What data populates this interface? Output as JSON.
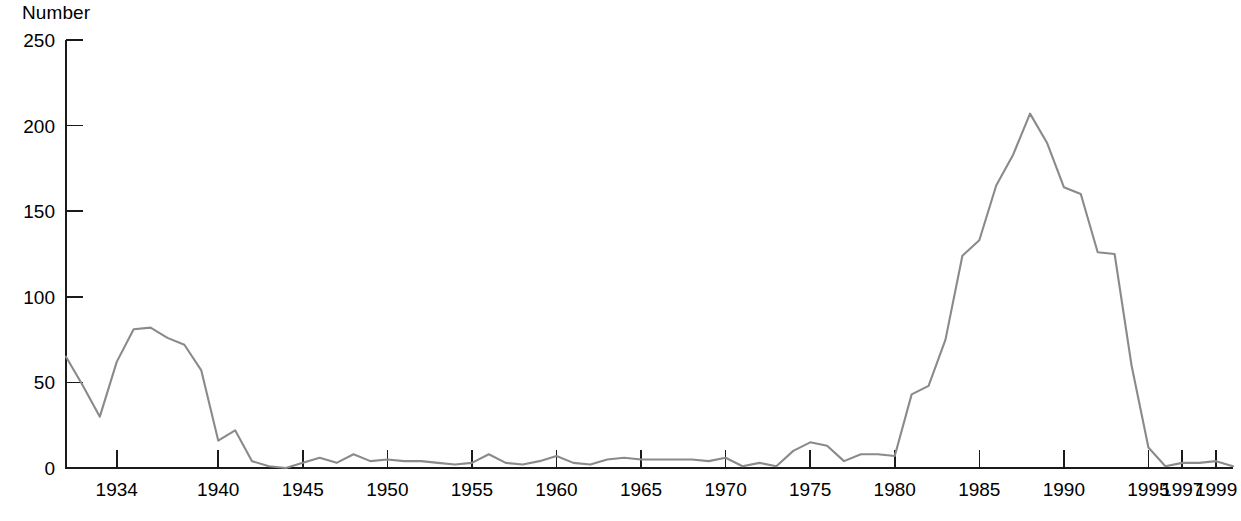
{
  "chart_data": {
    "type": "line",
    "title": "",
    "subtitle": "",
    "xlabel": "",
    "ylabel": "Number",
    "ylabel_position": "top-left",
    "xlim": [
      1931,
      2000
    ],
    "ylim": [
      0,
      250
    ],
    "grid": false,
    "legend": null,
    "legend_position": "none",
    "series_color": "#8a8a8a",
    "axis_color": "#1a1a1a",
    "y_ticks": [
      0,
      50,
      100,
      150,
      200,
      250
    ],
    "y_tick_labels": [
      "0",
      "50",
      "100",
      "150",
      "200",
      "250"
    ],
    "x_ticks": [
      1934,
      1940,
      1945,
      1950,
      1955,
      1960,
      1965,
      1970,
      1975,
      1980,
      1985,
      1990,
      1995,
      1997,
      1999
    ],
    "x_tick_labels": [
      "1934",
      "1940",
      "1945",
      "1950",
      "1955",
      "1960",
      "1965",
      "1970",
      "1975",
      "1980",
      "1985",
      "1990",
      "1995",
      "1997",
      "1999"
    ],
    "x": [
      1931,
      1932,
      1933,
      1934,
      1935,
      1936,
      1937,
      1938,
      1939,
      1940,
      1941,
      1942,
      1943,
      1944,
      1945,
      1946,
      1947,
      1948,
      1949,
      1950,
      1951,
      1952,
      1953,
      1954,
      1955,
      1956,
      1957,
      1958,
      1959,
      1960,
      1961,
      1962,
      1963,
      1964,
      1965,
      1966,
      1967,
      1968,
      1969,
      1970,
      1971,
      1972,
      1973,
      1974,
      1975,
      1976,
      1977,
      1978,
      1979,
      1980,
      1981,
      1982,
      1983,
      1984,
      1985,
      1986,
      1987,
      1988,
      1989,
      1990,
      1991,
      1992,
      1993,
      1994,
      1995,
      1996,
      1997,
      1998,
      1999,
      2000
    ],
    "values": [
      65,
      48,
      30,
      62,
      81,
      82,
      76,
      72,
      57,
      16,
      22,
      4,
      1,
      0,
      3,
      6,
      3,
      8,
      4,
      5,
      4,
      4,
      3,
      2,
      3,
      8,
      3,
      2,
      4,
      7,
      3,
      2,
      5,
      6,
      5,
      5,
      5,
      5,
      4,
      6,
      1,
      3,
      1,
      10,
      15,
      13,
      4,
      8,
      8,
      7,
      43,
      48,
      75,
      124,
      133,
      165,
      183,
      207,
      190,
      164,
      160,
      126,
      125,
      60,
      12,
      1,
      3,
      3,
      4,
      1
    ],
    "series_name": "Number",
    "annotations": []
  }
}
